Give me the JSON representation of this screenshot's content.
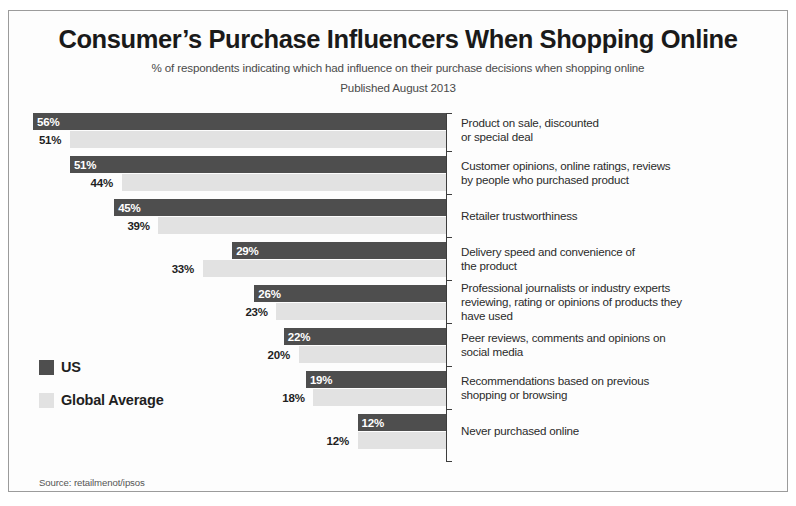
{
  "header": {
    "title": "Consumer’s Purchase Influencers When Shopping Online",
    "subtitle": "% of respondents indicating which had influence on their purchase decisions when shopping online",
    "published": "Published August 2013"
  },
  "legend": {
    "items": [
      {
        "label": "US",
        "color": "#4e4e4e",
        "swatch": "us"
      },
      {
        "label": "Global Average",
        "color": "#e2e2e2",
        "swatch": "global"
      }
    ]
  },
  "source": {
    "text": "Source: retailmenot/ipsos"
  },
  "colors": {
    "us": "#4e4e4e",
    "global": "#e2e2e2",
    "axis": "#3d3d3d",
    "frame": "#9b9b9b",
    "text": "#231f20"
  },
  "chart_data": {
    "type": "bar",
    "orientation": "horizontal",
    "title": "Consumer’s Purchase Influencers When Shopping Online",
    "subtitle": "% of respondents indicating which had influence on their purchase decisions when shopping online",
    "annotation": "Published August 2013",
    "xlabel": "",
    "ylabel": "",
    "xlim": [
      0,
      56
    ],
    "unit": "%",
    "grid": false,
    "legend_position": "left-middle",
    "bars_anchored": "right",
    "categories": [
      "Product on sale, discounted or special deal",
      "Customer opinions, online ratings, reviews by people who purchased product",
      "Retailer trustworthiness",
      "Delivery speed and convenience of the product",
      "Professional journalists or industry experts reviewing, rating or opinions of products they have used",
      "Peer reviews, comments and opinions on social media",
      "Recommendations based on previous shopping or browsing",
      "Never purchased online"
    ],
    "category_lines": [
      [
        "Product on sale, discounted",
        "or special deal"
      ],
      [
        "Customer opinions, online ratings, reviews",
        "by people who purchased product"
      ],
      [
        "Retailer trustworthiness"
      ],
      [
        "Delivery speed and convenience  of",
        "the product"
      ],
      [
        "Professional journalists or industry experts",
        "reviewing, rating or opinions of products they",
        "have used"
      ],
      [
        "Peer reviews, comments and opinions on",
        "social media"
      ],
      [
        "Recommendations based on previous",
        "shopping or browsing"
      ],
      [
        "Never purchased online"
      ]
    ],
    "series": [
      {
        "name": "US",
        "color": "#4e4e4e",
        "values": [
          56,
          51,
          45,
          29,
          26,
          22,
          19,
          12
        ],
        "labels": [
          "56%",
          "51%",
          "45%",
          "29%",
          "26%",
          "22%",
          "19%",
          "12%"
        ]
      },
      {
        "name": "Global Average",
        "color": "#e2e2e2",
        "values": [
          51,
          44,
          39,
          33,
          23,
          20,
          18,
          12
        ],
        "labels": [
          "51%",
          "44%",
          "39%",
          "33%",
          "23%",
          "20%",
          "18%",
          "12%"
        ]
      }
    ]
  }
}
